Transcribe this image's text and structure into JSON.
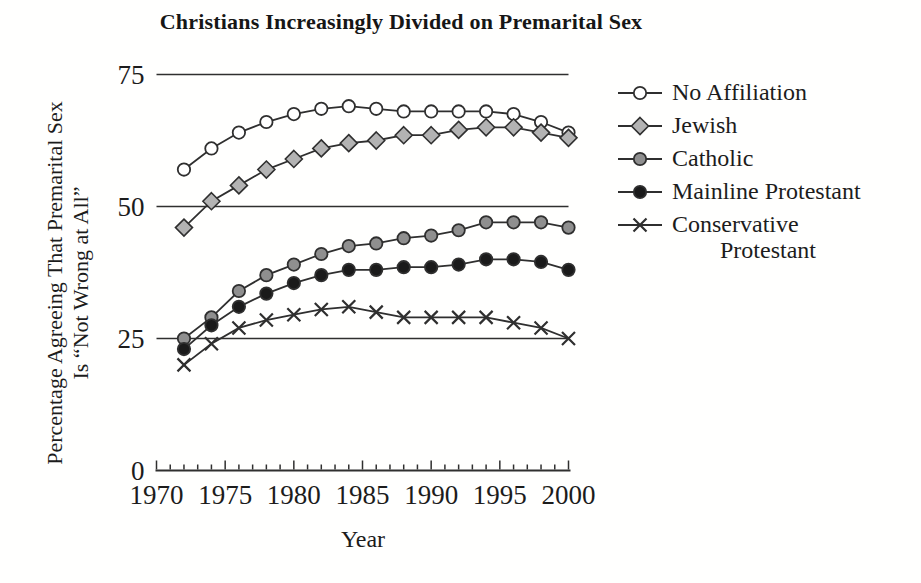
{
  "figure": {
    "title": "Christians Increasingly Divided on Premarital Sex",
    "y_axis_label_line1": "Percentage Agreeing That Premarital Sex",
    "y_axis_label_line2": "Is “Not Wrong at All”",
    "x_axis_label": "Year"
  },
  "chart_data": {
    "type": "line",
    "title": "Christians Increasingly Divided on Premarital Sex",
    "xlabel": "Year",
    "ylabel": "Percentage Agreeing That Premarital Sex Is “Not Wrong at All”",
    "xlim": [
      1970,
      2000
    ],
    "ylim": [
      0,
      75
    ],
    "y_gridlines": [
      25,
      50,
      75
    ],
    "y_tick_labels": [
      0,
      25,
      50,
      75
    ],
    "x_tick_labels": [
      1970,
      1975,
      1980,
      1985,
      1990,
      1995,
      2000
    ],
    "x_minor_tick_interval": 1,
    "grid": "horizontal",
    "legend_position": "right",
    "line_color": "#2f2f2f",
    "text_color": "#1c1c1c",
    "x": [
      1972,
      1974,
      1976,
      1978,
      1980,
      1982,
      1984,
      1986,
      1988,
      1990,
      1992,
      1994,
      1996,
      1998,
      2000
    ],
    "series": [
      {
        "name": "No Affiliation",
        "marker": "open-circle",
        "marker_fill": "#ffffff",
        "values": [
          57,
          61,
          64,
          66,
          67.5,
          68.5,
          69,
          68.5,
          68,
          68,
          68,
          68,
          67.5,
          66,
          64
        ]
      },
      {
        "name": "Jewish",
        "marker": "diamond",
        "marker_fill": "#b3b3b3",
        "values": [
          46,
          51,
          54,
          57,
          59,
          61,
          62,
          62.5,
          63.5,
          63.5,
          64.5,
          65,
          65,
          64,
          63
        ]
      },
      {
        "name": "Catholic",
        "marker": "circle",
        "marker_fill": "#8f8f8f",
        "values": [
          25,
          29,
          34,
          37,
          39,
          41,
          42.5,
          43,
          44,
          44.5,
          45.5,
          47,
          47,
          47,
          46
        ]
      },
      {
        "name": "Mainline Protestant",
        "marker": "circle",
        "marker_fill": "#1a1a1a",
        "values": [
          23,
          27.5,
          31,
          33.5,
          35.5,
          37,
          38,
          38,
          38.5,
          38.5,
          39,
          40,
          40,
          39.5,
          38
        ]
      },
      {
        "name": "Conservative Protestant",
        "legend_lines": [
          "Conservative",
          "Protestant"
        ],
        "marker": "x",
        "marker_fill": "none",
        "values": [
          20,
          24,
          27,
          28.5,
          29.5,
          30.5,
          31,
          30,
          29,
          29,
          29,
          29,
          28,
          27,
          25
        ]
      }
    ]
  }
}
